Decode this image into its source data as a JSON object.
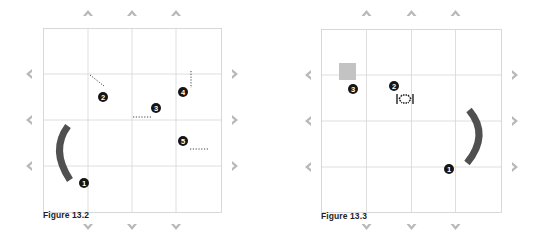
{
  "colors": {
    "grid_line": "#d6d6d6",
    "grid_border": "#cfcfcf",
    "arrow": "#b9b9b9",
    "arc": "#505050",
    "marker_fill": "#151515",
    "marker_text": "#ffffff",
    "dotted": "#444444",
    "square": "#c3c3c3"
  },
  "figures": [
    {
      "caption": "Figure 13.2",
      "grid": {
        "cols": 4,
        "rows": 4
      },
      "markers": [
        {
          "id": "1",
          "label": "1"
        },
        {
          "id": "2",
          "label": "2"
        },
        {
          "id": "3",
          "label": "3"
        },
        {
          "id": "4",
          "label": "4"
        },
        {
          "id": "5",
          "label": "5"
        }
      ],
      "shapes": [
        "arc-left",
        "dotted-diagonal",
        "dotted-horizontal",
        "dotted-vertical",
        "dotted-horizontal"
      ]
    },
    {
      "caption": "Figure 13.3",
      "grid": {
        "cols": 4,
        "rows": 4
      },
      "markers": [
        {
          "id": "1",
          "label": "1"
        },
        {
          "id": "2",
          "label": "2"
        },
        {
          "id": "3",
          "label": "3"
        }
      ],
      "shapes": [
        "arc-right",
        "move-cursor-icon",
        "gray-square"
      ]
    }
  ]
}
